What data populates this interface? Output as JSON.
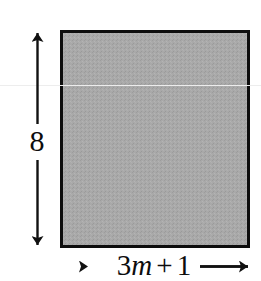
{
  "figure": {
    "kind": "geometry-diagram",
    "shape": "rectangle",
    "fill_color": "#a9a9a9",
    "stroke_color": "#0d0d0d",
    "background_color": "#ffffff",
    "rectangle": {
      "x": 60,
      "y": 30,
      "width": 190,
      "height": 218,
      "border_width": 3
    },
    "height_dimension": {
      "label": "8",
      "orientation": "vertical",
      "arrow_style": "double-headed",
      "value": "8"
    },
    "width_dimension": {
      "label": "3m + 1",
      "orientation": "horizontal",
      "arrow_style": "double-headed",
      "coefficient": "3",
      "variable": "m",
      "operator": "+",
      "constant": "1"
    }
  }
}
